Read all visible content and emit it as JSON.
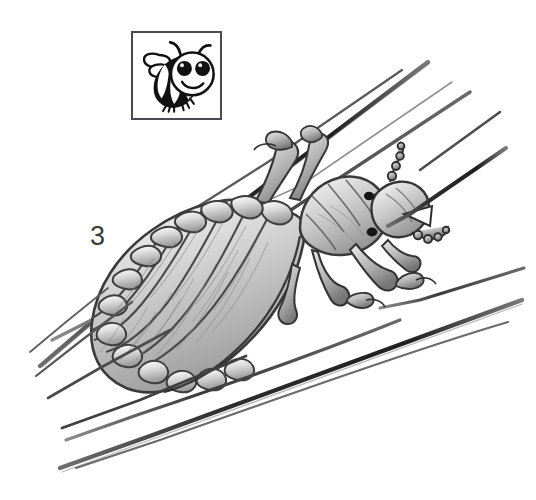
{
  "figure": {
    "number_label": "3",
    "style": "grayscale-pen-and-ink-illustration",
    "background_color": "#ffffff",
    "ink_color": "#2b2b2b",
    "midtone_color": "#8a8a8a",
    "highlight_color": "#f2f2f2"
  },
  "logo": {
    "name": "cartoon-bee-logo",
    "border_color": "#4a4a52",
    "fill_color": "#111111",
    "background_color": "#ffffff",
    "parts": [
      "striped-abdomen",
      "round-head",
      "two-large-eyes",
      "smile",
      "two-antennae",
      "two-wings",
      "two-legs"
    ]
  },
  "illustration": {
    "title": "Head louse gripping hair shafts",
    "elements": [
      "louse-body",
      "segmented-abdomen",
      "thorax",
      "head",
      "antennae",
      "six-clawed-legs",
      "hair-strands"
    ],
    "hair_strand_count": 8,
    "leg_count": 6,
    "abdominal_segment_count": 7
  }
}
